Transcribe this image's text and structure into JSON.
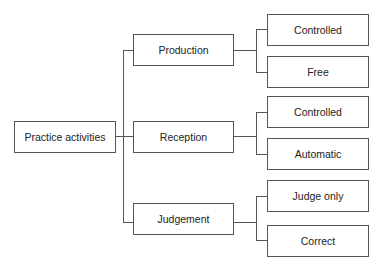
{
  "diagram": {
    "type": "tree",
    "root": {
      "label": "Practice activities"
    },
    "branches": [
      {
        "label": "Production",
        "children": [
          {
            "label": "Controlled"
          },
          {
            "label": "Free"
          }
        ]
      },
      {
        "label": "Reception",
        "children": [
          {
            "label": "Controlled"
          },
          {
            "label": "Automatic"
          }
        ]
      },
      {
        "label": "Judgement",
        "children": [
          {
            "label": "Judge only"
          },
          {
            "label": "Correct"
          }
        ]
      }
    ]
  }
}
